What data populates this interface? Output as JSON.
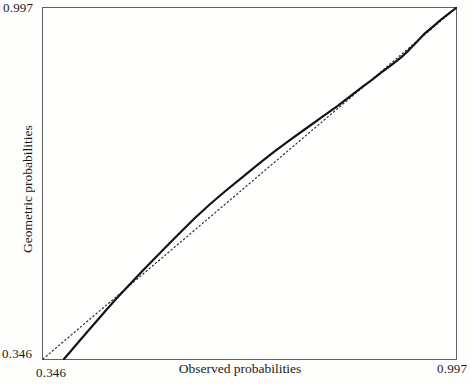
{
  "figure": {
    "background": "#fefefd",
    "frame_color": "#606060",
    "text_color": "#1a1a1a"
  },
  "chart_data": {
    "type": "line",
    "title": "",
    "xlabel": "Observed probabilities",
    "ylabel": "Geometric probabilities",
    "xlim": [
      0.346,
      0.997
    ],
    "ylim": [
      0.346,
      0.997
    ],
    "x_tick_labels": {
      "min": "0.346",
      "max": "0.997"
    },
    "y_tick_labels": {
      "min": "0.346",
      "max": "0.997"
    },
    "grid": false,
    "legend": null,
    "series": [
      {
        "name": "reference-diagonal",
        "style": "dotted",
        "color": "#2e2e2e",
        "width": 1.2,
        "points": [
          [
            0.346,
            0.346
          ],
          [
            0.997,
            0.997
          ]
        ]
      },
      {
        "name": "geometric-vs-observed-curve",
        "style": "solid",
        "color": "#141414",
        "width": 2.2,
        "points": [
          [
            0.379,
            0.346
          ],
          [
            0.39,
            0.361
          ],
          [
            0.403,
            0.379
          ],
          [
            0.417,
            0.398
          ],
          [
            0.431,
            0.417
          ],
          [
            0.445,
            0.436
          ],
          [
            0.46,
            0.456
          ],
          [
            0.48,
            0.481
          ],
          [
            0.5,
            0.506
          ],
          [
            0.52,
            0.53
          ],
          [
            0.54,
            0.554
          ],
          [
            0.56,
            0.578
          ],
          [
            0.585,
            0.607
          ],
          [
            0.61,
            0.634
          ],
          [
            0.635,
            0.659
          ],
          [
            0.66,
            0.683
          ],
          [
            0.685,
            0.707
          ],
          [
            0.71,
            0.73
          ],
          [
            0.735,
            0.752
          ],
          [
            0.76,
            0.773
          ],
          [
            0.785,
            0.794
          ],
          [
            0.81,
            0.815
          ],
          [
            0.83,
            0.833
          ],
          [
            0.85,
            0.851
          ],
          [
            0.865,
            0.864
          ],
          [
            0.88,
            0.878
          ],
          [
            0.895,
            0.891
          ],
          [
            0.91,
            0.905
          ],
          [
            0.922,
            0.918
          ],
          [
            0.935,
            0.934
          ],
          [
            0.948,
            0.95
          ],
          [
            0.962,
            0.964
          ],
          [
            0.975,
            0.977
          ],
          [
            0.986,
            0.987
          ],
          [
            0.997,
            0.997
          ]
        ]
      }
    ]
  }
}
